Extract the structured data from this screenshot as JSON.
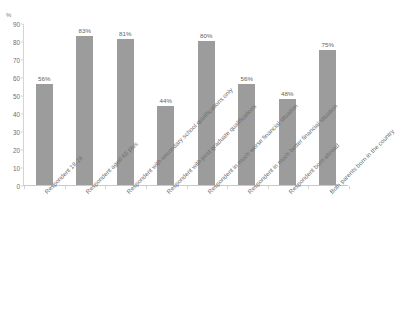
{
  "chart_data": {
    "type": "bar",
    "title": "",
    "subtitle": "",
    "xlabel": "",
    "ylabel": "%",
    "ylim": [
      0,
      90
    ],
    "y_ticks": [
      0,
      10,
      20,
      30,
      40,
      50,
      60,
      70,
      80,
      90
    ],
    "grid": false,
    "legend": "none",
    "bar_color": "#9c9c9c",
    "value_label_suffix": "%",
    "categories": [
      "Respondent 18-24",
      "Respondent aged 65 plus",
      "Respondent with secondary school qualifications only",
      "Respondent with post-graduate qualifications",
      "Respondent in much worse financial situation",
      "Respondent in much better financial situation",
      "Respondent born abroad",
      "Both parents born in the country"
    ],
    "values": [
      56,
      83,
      81,
      44,
      80,
      56,
      48,
      75
    ],
    "value_labels": [
      "56%",
      "83%",
      "81%",
      "44%",
      "80%",
      "56%",
      "48%",
      "75%"
    ]
  }
}
